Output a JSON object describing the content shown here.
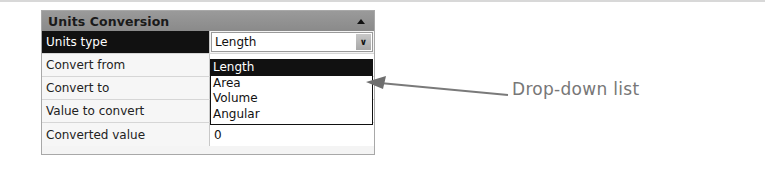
{
  "panel": {
    "title": "Units Conversion",
    "collapse_icon": "triangle-up-icon",
    "rows": [
      {
        "label": "Units type",
        "value": "Length",
        "selected": true,
        "type": "combo"
      },
      {
        "label": "Convert from",
        "value": ""
      },
      {
        "label": "Convert to",
        "value": ""
      },
      {
        "label": "Value to convert",
        "value": ""
      },
      {
        "label": "Converted value",
        "value": "0"
      }
    ],
    "combo_button_icon": "chevron-down-icon"
  },
  "dropdown": {
    "items": [
      "Length",
      "Area",
      "Volume",
      "Angular"
    ],
    "selected_index": 0
  },
  "annotation": {
    "text": "Drop-down list",
    "color": "#777777"
  },
  "colors": {
    "header_bg": "#8f8f8f",
    "selected_bg": "#111111",
    "panel_border": "#a8a8a8"
  }
}
